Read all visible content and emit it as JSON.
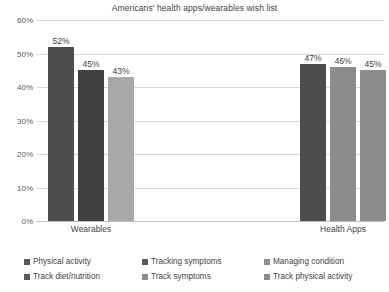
{
  "chart_data": {
    "type": "bar",
    "title": "Americans' health apps/wearables wish list",
    "xlabel": "",
    "ylabel": "",
    "ylim": [
      0,
      60
    ],
    "ytick_labels": [
      "0%",
      "10%",
      "20%",
      "30%",
      "40%",
      "50%",
      "60%"
    ],
    "ytick_values": [
      0,
      10,
      20,
      30,
      40,
      50,
      60
    ],
    "grid": true,
    "legend_position": "bottom",
    "categories": [
      "Wearables",
      "Health Apps"
    ],
    "series": [
      {
        "name": "Physical activity",
        "color": "#4d4d4d",
        "values": [
          52,
          null
        ],
        "labels": [
          "52%",
          ""
        ]
      },
      {
        "name": "Tracking symptoms",
        "color": "#404040",
        "values": [
          45,
          null
        ],
        "labels": [
          "45%",
          ""
        ]
      },
      {
        "name": "Managing condition",
        "color": "#a9a9a9",
        "values": [
          43,
          null
        ],
        "labels": [
          "43%",
          ""
        ]
      },
      {
        "name": "Track diet/nutrition",
        "color": "#4d4d4d",
        "values": [
          null,
          47
        ],
        "labels": [
          "",
          "47%"
        ]
      },
      {
        "name": "Track symptoms",
        "color": "#8c8c8c",
        "values": [
          null,
          46
        ],
        "labels": [
          "",
          "46%"
        ]
      },
      {
        "name": "Track physical activity",
        "color": "#8c8c8c",
        "values": [
          null,
          45
        ],
        "labels": [
          "",
          "45%"
        ]
      }
    ],
    "bars": [
      {
        "group": "Wearables",
        "series": "Physical activity",
        "value": 52,
        "label": "52%",
        "color": "#4d4d4d"
      },
      {
        "group": "Wearables",
        "series": "Tracking symptoms",
        "value": 45,
        "label": "45%",
        "color": "#404040"
      },
      {
        "group": "Wearables",
        "series": "Managing condition",
        "value": 43,
        "label": "43%",
        "color": "#a9a9a9"
      },
      {
        "group": "Health Apps",
        "series": "Track diet/nutrition",
        "value": 47,
        "label": "47%",
        "color": "#4d4d4d"
      },
      {
        "group": "Health Apps",
        "series": "Track symptoms",
        "value": 46,
        "label": "46%",
        "color": "#8c8c8c"
      },
      {
        "group": "Health Apps",
        "series": "Track physical activity",
        "value": 45,
        "label": "45%",
        "color": "#8c8c8c"
      }
    ]
  },
  "legend": {
    "items": [
      {
        "label": "Physical activity",
        "color": "#5a5a5a"
      },
      {
        "label": "Tracking symptoms",
        "color": "#5a5a5a"
      },
      {
        "label": "Managing condition",
        "color": "#8c8c8c"
      },
      {
        "label": "Track diet/nutrition",
        "color": "#5a5a5a"
      },
      {
        "label": "Track symptoms",
        "color": "#8c8c8c"
      },
      {
        "label": "Track physical activity",
        "color": "#8c8c8c"
      }
    ]
  }
}
